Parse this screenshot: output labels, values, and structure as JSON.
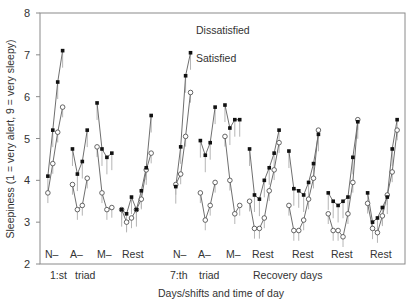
{
  "chart_data": {
    "type": "line",
    "title": "",
    "xlabel": "Days/shifts and time of day",
    "ylabel": "Sleepiness (1 = very alert, 9 = very sleepy)",
    "ylim": [
      2,
      8
    ],
    "yticks": [
      2,
      3,
      4,
      5,
      6,
      7,
      8
    ],
    "grid": false,
    "legend": "inline annotations near 7:th N- segment",
    "annotations": [
      "Dissatisfied",
      "Satisfied"
    ],
    "segment_labels": [
      "N–",
      "A–",
      "M–",
      "Rest",
      "N–",
      "A–",
      "M–",
      "Rest",
      "Rest",
      "Rest",
      "Rest"
    ],
    "group_labels": [
      "1:st",
      "triad",
      "7:th",
      "triad",
      "Recovery days"
    ],
    "segments": [
      {
        "label": "N– (1:st triad)",
        "x": [
          0,
          1,
          2,
          3
        ],
        "dissatisfied": [
          4.1,
          5.2,
          6.35,
          7.1
        ],
        "satisfied": [
          3.7,
          4.4,
          5.15,
          5.75
        ]
      },
      {
        "label": "A– (1:st triad)",
        "x": [
          5,
          6,
          7,
          8
        ],
        "dissatisfied": [
          4.75,
          4.15,
          4.45,
          5.2
        ],
        "satisfied": [
          3.9,
          3.3,
          3.4,
          4.05
        ]
      },
      {
        "label": "M– (1:st triad)",
        "x": [
          10,
          11,
          12,
          13
        ],
        "dissatisfied": [
          5.85,
          4.75,
          4.55,
          4.65
        ],
        "satisfied": [
          4.8,
          3.7,
          3.3,
          3.35
        ]
      },
      {
        "label": "Rest (1:st)",
        "x": [
          15,
          16,
          17,
          18,
          19,
          20,
          21
        ],
        "dissatisfied": [
          3.3,
          3.2,
          3.6,
          3.3,
          3.75,
          4.3,
          5.55
        ],
        "satisfied": [
          3.3,
          3.0,
          3.1,
          3.3,
          3.55,
          4.25,
          4.65
        ]
      },
      {
        "label": "N– (7:th triad)",
        "x": [
          26,
          27,
          28,
          29
        ],
        "dissatisfied": [
          3.85,
          4.8,
          6.5,
          7.05
        ],
        "satisfied": [
          3.9,
          4.15,
          5.05,
          6.1
        ]
      },
      {
        "label": "A– (7:th triad)",
        "x": [
          31,
          32,
          33,
          34
        ],
        "dissatisfied": [
          4.95,
          4.6,
          4.9,
          5.75
        ],
        "satisfied": [
          3.7,
          3.05,
          3.4,
          3.95
        ]
      },
      {
        "label": "M– (7:th triad)",
        "x": [
          36,
          37,
          38,
          39
        ],
        "dissatisfied": [
          5.8,
          5.25,
          5.45,
          5.45
        ],
        "satisfied": [
          5.05,
          4.0,
          3.2,
          3.4
        ]
      },
      {
        "label": "Rest (recovery 1)",
        "x": [
          41,
          42,
          43,
          44,
          45,
          46,
          47
        ],
        "dissatisfied": [
          4.75,
          3.65,
          3.55,
          4.0,
          4.3,
          4.65,
          5.2
        ],
        "satisfied": [
          3.5,
          2.85,
          2.85,
          3.1,
          3.75,
          4.25,
          4.9
        ]
      },
      {
        "label": "Rest (recovery 2)",
        "x": [
          49,
          50,
          51,
          52,
          53,
          54,
          55
        ],
        "dissatisfied": [
          4.7,
          3.8,
          3.75,
          3.65,
          3.95,
          4.4,
          5.1
        ],
        "satisfied": [
          3.4,
          2.8,
          2.8,
          3.05,
          3.55,
          4.05,
          5.2
        ]
      },
      {
        "label": "Rest (recovery 3)",
        "x": [
          57,
          58,
          59,
          60,
          61,
          62,
          63
        ],
        "dissatisfied": [
          3.7,
          3.5,
          3.4,
          3.5,
          3.6,
          4.55,
          5.4
        ],
        "satisfied": [
          3.2,
          2.8,
          2.8,
          2.65,
          3.2,
          3.95,
          5.45
        ]
      },
      {
        "label": "Rest (recovery 4)",
        "x": [
          65,
          66,
          67,
          68,
          69,
          70,
          71
        ],
        "dissatisfied": [
          3.7,
          3.0,
          3.1,
          3.35,
          3.6,
          4.75,
          5.45
        ],
        "satisfied": [
          3.45,
          2.85,
          2.75,
          3.15,
          3.65,
          4.2,
          5.2
        ]
      }
    ],
    "xrange": [
      -1.6,
      72.6
    ]
  }
}
